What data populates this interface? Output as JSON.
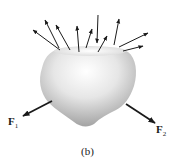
{
  "figure": {
    "caption": "(b)",
    "body": {
      "description": "deformable body with cut surface on top",
      "fill_light": "#ffffff",
      "fill_dark": "#9a9a9a"
    },
    "distributed_arrows": [
      {
        "x1": 60,
        "y1": 50,
        "x2": 33,
        "y2": 30
      },
      {
        "x1": 59,
        "y1": 48,
        "x2": 45,
        "y2": 20
      },
      {
        "x1": 70,
        "y1": 50,
        "x2": 56,
        "y2": 25
      },
      {
        "x1": 79,
        "y1": 52,
        "x2": 77,
        "y2": 26
      },
      {
        "x1": 86,
        "y1": 48,
        "x2": 92,
        "y2": 29
      },
      {
        "x1": 98,
        "y1": 15,
        "x2": 97,
        "y2": 43
      },
      {
        "x1": 98,
        "y1": 52,
        "x2": 107,
        "y2": 36
      },
      {
        "x1": 114,
        "y1": 45,
        "x2": 119,
        "y2": 19
      },
      {
        "x1": 119,
        "y1": 47,
        "x2": 148,
        "y2": 33
      },
      {
        "x1": 123,
        "y1": 51,
        "x2": 143,
        "y2": 46
      }
    ],
    "forces": [
      {
        "name": "F",
        "sub": "1",
        "x1": 52,
        "y1": 101,
        "x2": 23,
        "y2": 116
      },
      {
        "name": "F",
        "sub": "2",
        "x1": 126,
        "y1": 104,
        "x2": 155,
        "y2": 123
      }
    ],
    "arrow_color": "#1a1a1a"
  }
}
